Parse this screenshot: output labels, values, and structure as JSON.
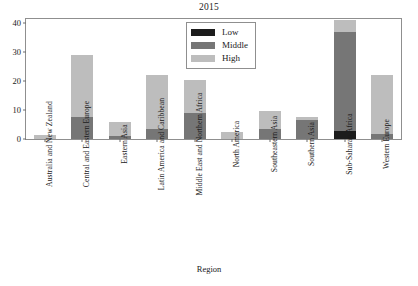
{
  "chart_data": {
    "type": "bar",
    "subtype": "stacked-vertical",
    "title": "2015",
    "xlabel": "Region",
    "ylabel": "",
    "ylim": [
      0,
      41.5
    ],
    "yticks": [
      0,
      10,
      20,
      30,
      40
    ],
    "ytick_labels": [
      "0",
      "10",
      "20",
      "30",
      "40"
    ],
    "grid": false,
    "legend_position": "top-center",
    "categories": [
      "Australia and New Zealand",
      "Central and Eastern Europe",
      "Eastern Asia",
      "Latin America and Caribbean",
      "Middle East and Northern Africa",
      "North America",
      "Southeastern Asia",
      "Southern Asia",
      "Sub-Saharan Africa",
      "Western Europe"
    ],
    "series": [
      {
        "name": "Low",
        "color": "#1c1c1c",
        "values": [
          0,
          0,
          0,
          0,
          0,
          0,
          0,
          0,
          2.8,
          0
        ]
      },
      {
        "name": "Middle",
        "color": "#767676",
        "values": [
          0,
          7.5,
          1.2,
          3.5,
          9.0,
          0,
          3.6,
          6.5,
          34.2,
          1.8
        ]
      },
      {
        "name": "High",
        "color": "#bdbdbd",
        "values": [
          1.5,
          21.5,
          4.8,
          18.7,
          11.5,
          2.5,
          6.0,
          1.0,
          4.0,
          20.2
        ]
      }
    ],
    "totals": [
      1.5,
      29.0,
      6.0,
      22.2,
      20.5,
      2.5,
      9.6,
      7.5,
      41.0,
      22.0
    ]
  },
  "legend": {
    "entries": [
      {
        "label": "Low",
        "color": "#1c1c1c"
      },
      {
        "label": "Middle",
        "color": "#767676"
      },
      {
        "label": "High",
        "color": "#bdbdbd"
      }
    ]
  }
}
